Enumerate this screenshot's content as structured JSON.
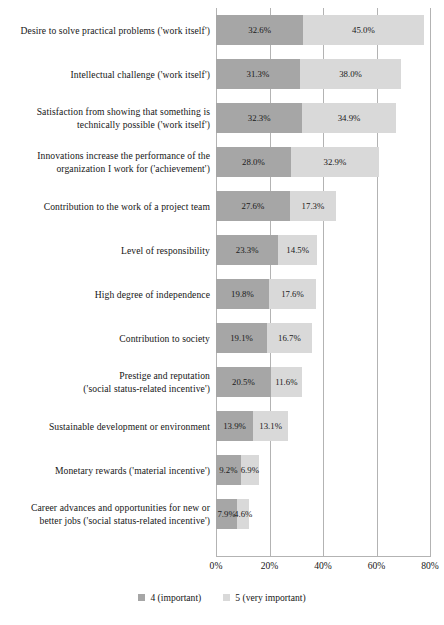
{
  "chart_data": {
    "type": "bar",
    "subtype": "horizontal-stacked-bar",
    "title": "",
    "xlabel": "",
    "ylabel": "",
    "xlim": [
      0,
      80
    ],
    "xticks": [
      "0%",
      "20%",
      "40%",
      "60%",
      "80%"
    ],
    "xtick_values": [
      0,
      20,
      40,
      60,
      80
    ],
    "grid": true,
    "legend_position": "bottom-center",
    "value_suffix": "%",
    "colors": {
      "series_important": "#a6a6a6",
      "series_very_important": "#d9d9d9",
      "gridline": "#b3b3b3",
      "text": "#161616",
      "background": "#ffffff"
    },
    "legend": [
      {
        "label": "4 (important)",
        "color": "#a6a6a6"
      },
      {
        "label": "5 (very important)",
        "color": "#d9d9d9"
      }
    ],
    "categories": [
      "Desire to solve practical problems ('work itself')",
      "Intellectual challenge ('work itself')",
      "Satisfaction from showing that something is technically possible ('work itself')",
      "Innovations increase the performance of the organization I work for ('achievement')",
      "Contribution to the work of a project team",
      "Level of responsibility",
      "High degree of independence",
      "Contribution to society",
      "Prestige and reputation ('social status-related incentive')",
      "Sustainable development or environment",
      "Monetary rewards ('material incentive')",
      "Career advances and opportunities for new or better jobs ('social status-related incentive')"
    ],
    "series": [
      {
        "name": "4 (important)",
        "values": [
          32.6,
          31.3,
          32.3,
          28.0,
          27.6,
          23.3,
          19.8,
          19.1,
          20.5,
          13.9,
          9.2,
          7.9
        ]
      },
      {
        "name": "5 (very important)",
        "values": [
          45.0,
          38.0,
          34.9,
          32.9,
          17.3,
          14.5,
          17.6,
          16.7,
          11.6,
          13.1,
          6.9,
          4.6
        ]
      }
    ]
  },
  "rows": [
    {
      "label_lines": [
        "Desire to solve practical problems ('work itself')"
      ],
      "a": 32.6,
      "b": 45.0,
      "a_text": "32.6%",
      "b_text": "45.0%"
    },
    {
      "label_lines": [
        "Intellectual challenge ('work itself')"
      ],
      "a": 31.3,
      "b": 38.0,
      "a_text": "31.3%",
      "b_text": "38.0%"
    },
    {
      "label_lines": [
        "Satisfaction from showing that something is",
        "technically possible ('work itself')"
      ],
      "a": 32.3,
      "b": 34.9,
      "a_text": "32.3%",
      "b_text": "34.9%"
    },
    {
      "label_lines": [
        "Innovations increase the performance of the",
        "organization I work for ('achievement')"
      ],
      "a": 28.0,
      "b": 32.9,
      "a_text": "28.0%",
      "b_text": "32.9%"
    },
    {
      "label_lines": [
        "Contribution to the work of a project team"
      ],
      "a": 27.6,
      "b": 17.3,
      "a_text": "27.6%",
      "b_text": "17.3%"
    },
    {
      "label_lines": [
        "Level of responsibility"
      ],
      "a": 23.3,
      "b": 14.5,
      "a_text": "23.3%",
      "b_text": "14.5%"
    },
    {
      "label_lines": [
        "High degree of independence"
      ],
      "a": 19.8,
      "b": 17.6,
      "a_text": "19.8%",
      "b_text": "17.6%"
    },
    {
      "label_lines": [
        "Contribution to society"
      ],
      "a": 19.1,
      "b": 16.7,
      "a_text": "19.1%",
      "b_text": "16.7%"
    },
    {
      "label_lines": [
        "Prestige and reputation",
        "('social status-related incentive')"
      ],
      "a": 20.5,
      "b": 11.6,
      "a_text": "20.5%",
      "b_text": "11.6%"
    },
    {
      "label_lines": [
        "Sustainable development or environment"
      ],
      "a": 13.9,
      "b": 13.1,
      "a_text": "13.9%",
      "b_text": "13.1%"
    },
    {
      "label_lines": [
        "Monetary rewards ('material incentive')"
      ],
      "a": 9.2,
      "b": 6.9,
      "a_text": "9.2%",
      "b_text": "6.9%"
    },
    {
      "label_lines": [
        "Career advances and opportunities for new or",
        "better jobs ('social status-related incentive')"
      ],
      "a": 7.9,
      "b": 4.6,
      "a_text": "7.9%",
      "b_text": "4.6%"
    }
  ],
  "xaxis": {
    "ticks": [
      "0%",
      "20%",
      "40%",
      "60%",
      "80%"
    ]
  },
  "legend": {
    "items": [
      {
        "label": "4 (important)",
        "color": "#a6a6a6"
      },
      {
        "label": "5 (very important)",
        "color": "#d9d9d9"
      }
    ]
  }
}
